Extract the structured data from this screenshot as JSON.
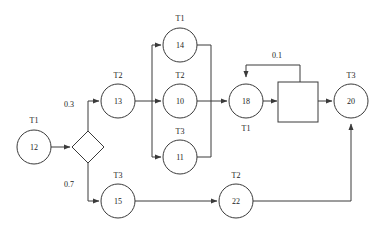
{
  "diagram": {
    "background_color": "#ffffff",
    "stroke_color": "#3a3a3a",
    "text_color": "#222222",
    "nodes": [
      {
        "key": "n12",
        "id": "12",
        "type_label": "T1",
        "shape": "circle",
        "label_position": "above",
        "cx": 34,
        "cy": 147,
        "r": 17
      },
      {
        "key": "d1",
        "id": "",
        "type_label": "",
        "shape": "diamond",
        "label_position": "none",
        "cx": 88,
        "cy": 147,
        "r": 16
      },
      {
        "key": "n13",
        "id": "13",
        "type_label": "T2",
        "shape": "circle",
        "label_position": "above",
        "cx": 118,
        "cy": 101,
        "r": 17
      },
      {
        "key": "n14",
        "id": "14",
        "type_label": "T1",
        "shape": "circle",
        "label_position": "above",
        "cx": 180,
        "cy": 45,
        "r": 17
      },
      {
        "key": "n10",
        "id": "10",
        "type_label": "T2",
        "shape": "circle",
        "label_position": "above",
        "cx": 180,
        "cy": 101,
        "r": 17
      },
      {
        "key": "n11",
        "id": "11",
        "type_label": "T3",
        "shape": "circle",
        "label_position": "above",
        "cx": 180,
        "cy": 157,
        "r": 17
      },
      {
        "key": "n18",
        "id": "18",
        "type_label": "T1",
        "shape": "circle",
        "label_position": "below",
        "cx": 246,
        "cy": 101,
        "r": 17
      },
      {
        "key": "sq1",
        "id": "",
        "type_label": "",
        "shape": "square",
        "label_position": "none",
        "cx": 298,
        "cy": 102,
        "r": 20
      },
      {
        "key": "n20",
        "id": "20",
        "type_label": "T3",
        "shape": "circle",
        "label_position": "above",
        "cx": 351,
        "cy": 101,
        "r": 17
      },
      {
        "key": "n15",
        "id": "15",
        "type_label": "T3",
        "shape": "circle",
        "label_position": "above",
        "cx": 118,
        "cy": 201,
        "r": 17
      },
      {
        "key": "n22",
        "id": "22",
        "type_label": "T2",
        "shape": "circle",
        "label_position": "above",
        "cx": 236,
        "cy": 201,
        "r": 17
      }
    ],
    "edge_labels": [
      {
        "key": "p03",
        "text": "0.3",
        "x": 69,
        "y": 107
      },
      {
        "key": "p07",
        "text": "0.7",
        "x": 69,
        "y": 187
      },
      {
        "key": "p01",
        "text": "0.1",
        "x": 277,
        "y": 58
      }
    ],
    "edges": [
      {
        "key": "e-12-d1",
        "from": "12",
        "to": "decision",
        "label": "",
        "arrow": true
      },
      {
        "key": "e-d1-13",
        "from": "decision",
        "to": "13",
        "label": "0.3",
        "arrow": true
      },
      {
        "key": "e-d1-15",
        "from": "decision",
        "to": "15",
        "label": "0.7",
        "arrow": true
      },
      {
        "key": "e-13-split",
        "from": "13",
        "to": "split-bar",
        "label": "",
        "arrow": false
      },
      {
        "key": "e-split-14",
        "from": "split-bar",
        "to": "14",
        "label": "",
        "arrow": true
      },
      {
        "key": "e-split-10",
        "from": "split-bar",
        "to": "10",
        "label": "",
        "arrow": true
      },
      {
        "key": "e-split-11",
        "from": "split-bar",
        "to": "11",
        "label": "",
        "arrow": true
      },
      {
        "key": "e-14-merge",
        "from": "14",
        "to": "merge-bar",
        "label": "",
        "arrow": false
      },
      {
        "key": "e-10-merge",
        "from": "10",
        "to": "merge-bar",
        "label": "",
        "arrow": false
      },
      {
        "key": "e-11-merge",
        "from": "11",
        "to": "merge-bar",
        "label": "",
        "arrow": false
      },
      {
        "key": "e-merge-18",
        "from": "merge-bar",
        "to": "18",
        "label": "",
        "arrow": true
      },
      {
        "key": "e-18-sq",
        "from": "18",
        "to": "square",
        "label": "",
        "arrow": true
      },
      {
        "key": "e-sq-20",
        "from": "square",
        "to": "20",
        "label": "",
        "arrow": true
      },
      {
        "key": "e-sq-18",
        "from": "square",
        "to": "18",
        "label": "0.1",
        "arrow": true
      },
      {
        "key": "e-15-22",
        "from": "15",
        "to": "22",
        "label": "",
        "arrow": true
      },
      {
        "key": "e-22-20",
        "from": "22",
        "to": "20",
        "label": "",
        "arrow": true
      }
    ]
  }
}
